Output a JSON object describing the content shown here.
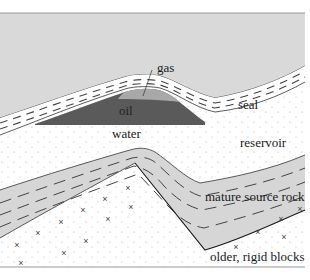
{
  "diagram": {
    "colors": {
      "upper_rock": "#d9d9d9",
      "seal": "#ffffff",
      "gas": "#a8a8a8",
      "oil": "#5a5a5a",
      "reservoir": "#ffffff",
      "reservoir_dots": "#b0b0b0",
      "source_rock": "#d6d6d6",
      "basement": "#ffffff",
      "line": "#333333",
      "dash": "#444444",
      "border": "#9a9a9a"
    },
    "labels": {
      "gas": "gas",
      "oil": "oil",
      "seal": "seal",
      "water": "water",
      "reservoir": "reservoir",
      "source_rock": "mature source rock",
      "basement": "older, rigid blocks"
    },
    "basement_marker": "×"
  }
}
